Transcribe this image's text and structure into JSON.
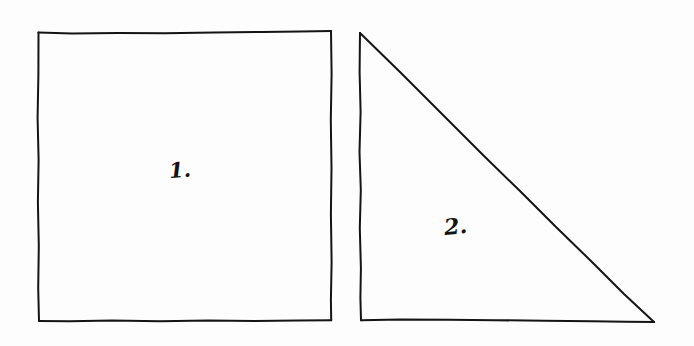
{
  "page": {
    "background_color": "#fdfdfd",
    "ink_color": "#141414",
    "width": 694,
    "height": 346,
    "medium": "hand-drawn ink sketch"
  },
  "shapes": [
    {
      "id": "square",
      "name": "square",
      "label": "1.",
      "label_position": {
        "x": 168,
        "y": 158
      },
      "stroke_color": "#141414",
      "stroke_width": 2,
      "fill": "none",
      "vertices": [
        {
          "x": 38,
          "y": 32
        },
        {
          "x": 331,
          "y": 31
        },
        {
          "x": 331,
          "y": 320
        },
        {
          "x": 39,
          "y": 321
        }
      ]
    },
    {
      "id": "triangle",
      "name": "right-triangle",
      "label": "2.",
      "label_position": {
        "x": 443,
        "y": 214
      },
      "stroke_color": "#141414",
      "stroke_width": 2,
      "fill": "none",
      "vertices": [
        {
          "x": 360,
          "y": 33
        },
        {
          "x": 654,
          "y": 322
        },
        {
          "x": 361,
          "y": 320
        }
      ]
    }
  ],
  "paths": {
    "square_top": "M 38.5 32.5 L 72 33.6 L 118 33.0 L 165 33.3 L 214 32.4 L 262 32.0 L 300 31.4 L 331 31.0",
    "square_right": "M 331 31.0 L 331.6 74 L 330.8 120 L 331.5 168 L 330.9 214 L 331.6 262 L 330.9 300 L 331.2 320.2",
    "square_bottom": "M 331.2 320.2 L 298 320.6 L 254 321.0 L 208 320.4 L 160 321.2 L 112 320.6 L 70 321.3 L 39 321.0",
    "square_left": "M 39 321.0 L 38.2 288 L 38.8 246 L 37.9 202 L 38.6 160 L 37.6 118 L 38.4 74 L 38.5 32.5",
    "triangle_left": "M 360 33 L 359.6 72 L 360.6 112 L 359.5 152 L 360.8 190 L 359.8 228 L 360.9 268 L 360.4 298 L 361 320.2",
    "triangle_bottom": "M 361 320.2 L 400 319.4 L 448 319.8 L 496 320.2 L 544 320.8 L 592 321.3 L 626 321.7 L 654 322",
    "triangle_hypotenuse": "M 360 33 L 400 72 L 442 114 L 484 156 L 520 191 L 556 227 L 592 262 L 624 294 L 654 322"
  },
  "labels": {
    "square_label": "1.",
    "triangle_label": "2."
  }
}
